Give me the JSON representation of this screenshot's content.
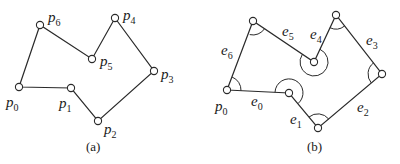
{
  "panels": [
    {
      "id": "a",
      "caption": "(a)",
      "vertices": [
        {
          "label": "p",
          "sub": "0",
          "x": 19,
          "y": 87,
          "lx": 6,
          "ly": 107
        },
        {
          "label": "p",
          "sub": "1",
          "x": 71,
          "y": 88,
          "lx": 59,
          "ly": 108
        },
        {
          "label": "p",
          "sub": "2",
          "x": 98,
          "y": 121,
          "lx": 104,
          "ly": 134
        },
        {
          "label": "p",
          "sub": "3",
          "x": 154,
          "y": 71,
          "lx": 162,
          "ly": 79
        },
        {
          "label": "p",
          "sub": "4",
          "x": 115,
          "y": 18,
          "lx": 123,
          "ly": 20
        },
        {
          "label": "p",
          "sub": "5",
          "x": 92,
          "y": 59,
          "lx": 100,
          "ly": 66
        },
        {
          "label": "p",
          "sub": "6",
          "x": 40,
          "y": 25,
          "lx": 48,
          "ly": 22
        }
      ]
    },
    {
      "id": "b",
      "caption": "(b)",
      "start_label": {
        "label": "p",
        "sub": "0"
      },
      "vertices": [
        {
          "x": 227,
          "y": 90
        },
        {
          "x": 289,
          "y": 93
        },
        {
          "x": 318,
          "y": 128
        },
        {
          "x": 382,
          "y": 74
        },
        {
          "x": 336,
          "y": 15
        },
        {
          "x": 314,
          "y": 62
        },
        {
          "x": 253,
          "y": 21
        }
      ],
      "edges": [
        {
          "label": "e",
          "sub": "0",
          "lx": 251,
          "ly": 106
        },
        {
          "label": "e",
          "sub": "1",
          "lx": 290,
          "ly": 124
        },
        {
          "label": "e",
          "sub": "2",
          "lx": 357,
          "ly": 112
        },
        {
          "label": "e",
          "sub": "3",
          "lx": 366,
          "ly": 45
        },
        {
          "label": "e",
          "sub": "4",
          "lx": 309,
          "ly": 40
        },
        {
          "label": "e",
          "sub": "5",
          "lx": 282,
          "ly": 36
        },
        {
          "label": "e",
          "sub": "6",
          "lx": 221,
          "ly": 55
        }
      ]
    }
  ]
}
